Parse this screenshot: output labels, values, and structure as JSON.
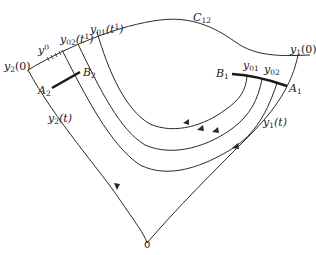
{
  "diagram": {
    "type": "phase-portrait",
    "labels": {
      "c12": {
        "base": "C",
        "sub": "12"
      },
      "y1_0": {
        "base": "y",
        "sub": "1",
        "arg": "(0)"
      },
      "y2_0": {
        "base": "y",
        "sub": "2",
        "arg": "(0)"
      },
      "y0": {
        "base": "y",
        "sup": "0"
      },
      "y02_t1": {
        "base": "y",
        "sub": "02",
        "arg": "(t",
        "argsup": "1",
        "close": ")"
      },
      "y01_t1": {
        "base": "y",
        "sub": "01",
        "arg": "(t",
        "argsup": "1",
        "close": ")"
      },
      "b1": {
        "base": "B",
        "sub": "1"
      },
      "b2": {
        "base": "B",
        "sub": "2"
      },
      "a1": {
        "base": "A",
        "sub": "1"
      },
      "a2": {
        "base": "A",
        "sub": "2"
      },
      "y01": {
        "base": "y",
        "sub": "01"
      },
      "y02": {
        "base": "y",
        "sub": "02"
      },
      "y1_t": {
        "base": "y",
        "sub": "1",
        "arg": "(t)"
      },
      "y2_t": {
        "base": "y",
        "sub": "2",
        "arg": "(t)"
      },
      "origin": "0"
    },
    "stroke_color": "#2a2a2a"
  }
}
